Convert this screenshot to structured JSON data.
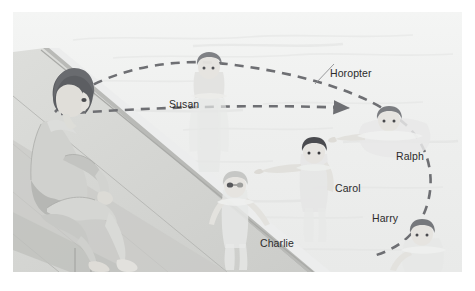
{
  "figure": {
    "scene_description": "A woman sits on the edge of a swimming pool deck looking at a boy in the water; a dashed curve marks the horopter through several swimmers.",
    "background_color": "#f2f3f2",
    "page_background": "#ffffff",
    "water_color": "#eeefee",
    "deck_color": "#d8d9d6",
    "deck_shadow_color": "#c3c4c1",
    "dash_color": "#6e6f73",
    "label_color": "#2b2b2b",
    "hair_color": "#6f7175",
    "skin_color": "#e3e2de"
  },
  "labels": [
    {
      "id": "susan",
      "text": "Susan"
    },
    {
      "id": "horopter",
      "text": "Horopter"
    },
    {
      "id": "ralph",
      "text": "Ralph"
    },
    {
      "id": "carol",
      "text": "Carol"
    },
    {
      "id": "charlie",
      "text": "Charlie"
    },
    {
      "id": "harry",
      "text": "Harry"
    }
  ],
  "annotations": {
    "gaze_arrow": "dashed arrow from observer's eyes to Ralph",
    "horopter_curve": "large dashed arc through observer, Susan, Ralph and Harry",
    "leader_line": "thin line from the Horopter label to the dashed curve"
  },
  "people": [
    {
      "id": "observer",
      "role": "seated woman on pool deck",
      "label": ""
    },
    {
      "id": "susan",
      "role": "swimmer far side of pool",
      "label": "Susan"
    },
    {
      "id": "ralph",
      "role": "swimmer at fixation point",
      "label": "Ralph"
    },
    {
      "id": "carol",
      "role": "swimmer mid pool",
      "label": "Carol"
    },
    {
      "id": "charlie",
      "role": "swimmer near pool edge",
      "label": "Charlie"
    },
    {
      "id": "harry",
      "role": "swimmer lower right",
      "label": "Harry"
    }
  ]
}
